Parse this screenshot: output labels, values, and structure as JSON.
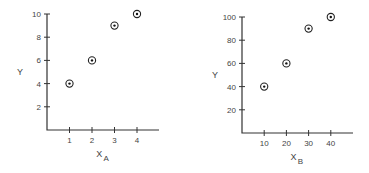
{
  "chart_data": [
    {
      "type": "scatter",
      "title": "",
      "xlabel": "X",
      "xlabel_subscript": "A",
      "ylabel": "Y",
      "x": [
        1,
        2,
        3,
        4
      ],
      "y": [
        4,
        6,
        9,
        10
      ],
      "xticks": [
        1,
        2,
        3,
        4
      ],
      "yticks": [
        2,
        4,
        6,
        8,
        10
      ],
      "xlim": [
        0,
        5
      ],
      "ylim": [
        0,
        10
      ],
      "grid": false,
      "marker": "circled-dot",
      "layout": {
        "origin": [
          47,
          130
        ],
        "x_unit_px": 22.5,
        "y_unit_px": 11.6,
        "x_axis_end": 159
      }
    },
    {
      "type": "scatter",
      "title": "",
      "xlabel": "X",
      "xlabel_subscript": "B",
      "ylabel": "Y",
      "x": [
        10,
        20,
        30,
        40
      ],
      "y": [
        40,
        60,
        90,
        100
      ],
      "xticks": [
        10,
        20,
        30,
        40
      ],
      "yticks": [
        20,
        40,
        60,
        80,
        100
      ],
      "xlim": [
        0,
        50
      ],
      "ylim": [
        0,
        100
      ],
      "grid": false,
      "marker": "circled-dot",
      "layout": {
        "origin": [
          242,
          133
        ],
        "x_unit_px": 2.22,
        "y_unit_px": 1.16,
        "x_axis_end": 353
      }
    }
  ]
}
